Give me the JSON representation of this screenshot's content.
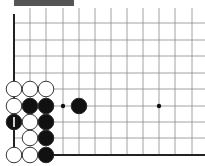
{
  "header": {
    "title": ""
  },
  "board": {
    "columns_x": [
      14,
      30,
      46,
      63,
      79,
      95,
      111,
      127,
      143,
      159,
      175,
      192
    ],
    "rows_y": [
      23,
      40,
      56,
      73,
      89,
      106,
      122,
      138,
      155
    ],
    "edge_left_x": 14,
    "edge_bottom_y": 155,
    "grid_color": "#8a8a8a",
    "edge_color": "#222222",
    "star_points": [
      {
        "col": 9,
        "row": 5
      }
    ],
    "markers": [
      {
        "type": "dot",
        "col": 3,
        "row": 5
      }
    ],
    "stones": [
      {
        "color": "white",
        "col": 0,
        "row": 4
      },
      {
        "color": "white",
        "col": 1,
        "row": 4
      },
      {
        "color": "white",
        "col": 2,
        "row": 4
      },
      {
        "color": "white",
        "col": 0,
        "row": 5
      },
      {
        "color": "black",
        "col": 1,
        "row": 5
      },
      {
        "color": "black",
        "col": 2,
        "row": 5
      },
      {
        "color": "black",
        "col": 4,
        "row": 5
      },
      {
        "color": "black",
        "col": 0,
        "row": 6,
        "label": "1"
      },
      {
        "color": "white",
        "col": 1,
        "row": 6
      },
      {
        "color": "black",
        "col": 2,
        "row": 6
      },
      {
        "color": "white",
        "col": 1,
        "row": 7
      },
      {
        "color": "black",
        "col": 2,
        "row": 7
      },
      {
        "color": "white",
        "col": 0,
        "row": 8
      },
      {
        "color": "white",
        "col": 1,
        "row": 8
      },
      {
        "color": "black",
        "col": 2,
        "row": 8
      }
    ]
  }
}
